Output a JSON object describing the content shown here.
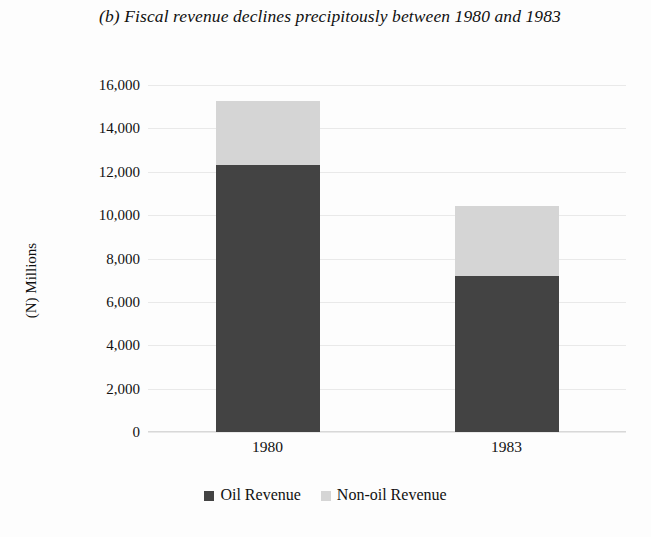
{
  "chart_data": {
    "type": "bar",
    "subtype": "stacked-column",
    "title": "(b) Fiscal revenue declines precipitously between 1980 and 1983",
    "xlabel": "",
    "ylabel": "(N) Millions",
    "categories": [
      "1980",
      "1983"
    ],
    "series": [
      {
        "name": "Oil Revenue",
        "values": [
          12300,
          7180
        ],
        "color": "#434343"
      },
      {
        "name": "Non-oil Revenue",
        "values": [
          2950,
          3220
        ],
        "color": "#d5d5d5"
      }
    ],
    "totals": [
      15250,
      10400
    ],
    "ylim": [
      0,
      16000
    ],
    "ytick_step": 2000,
    "ytick_labels": [
      "16,000",
      "14,000",
      "12,000",
      "10,000",
      "8,000",
      "6,000",
      "4,000",
      "2,000",
      "0"
    ],
    "ytick_values": [
      16000,
      14000,
      12000,
      10000,
      8000,
      6000,
      4000,
      2000,
      0
    ],
    "grid": true,
    "grid_axis": "y",
    "legend_position": "bottom",
    "background_color": "#fdfdfd"
  },
  "legend": {
    "items": [
      {
        "label": "Oil Revenue"
      },
      {
        "label": "Non-oil Revenue"
      }
    ]
  }
}
